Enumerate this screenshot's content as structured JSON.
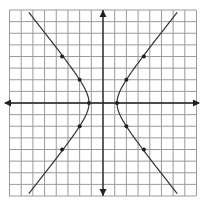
{
  "figure": {
    "type": "hyperbola-graph",
    "grid": {
      "x_min": -8,
      "x_max": 8,
      "y_min": -8,
      "y_max": 8,
      "spacing_units": 1,
      "color": "#9a9a9a"
    },
    "axes": {
      "color": "#222222",
      "arrows": true
    },
    "hyperbola": {
      "orientation": "horizontal",
      "center": [
        0,
        0
      ],
      "a": 1.2,
      "b": 1.5,
      "color": "#333333"
    },
    "points": [
      {
        "x": -1.2,
        "y": 0
      },
      {
        "x": 1.2,
        "y": 0
      },
      {
        "x": -2,
        "y": 2
      },
      {
        "x": 2,
        "y": 2
      },
      {
        "x": -2,
        "y": -2
      },
      {
        "x": 2,
        "y": -2
      },
      {
        "x": -3.5,
        "y": 4
      },
      {
        "x": 3.5,
        "y": 4
      },
      {
        "x": -3.5,
        "y": -4
      },
      {
        "x": 3.5,
        "y": -4
      }
    ]
  }
}
